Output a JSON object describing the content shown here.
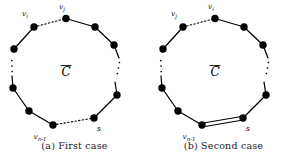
{
  "figure": {
    "panels": [
      {
        "id": "first-case",
        "caption": "(a) First case",
        "center_label": "C",
        "center_label_overline": true,
        "special_edge_style": "dashed",
        "labels": {
          "top_left": {
            "base": "v",
            "sub": "i",
            "text": "vi"
          },
          "top_right": {
            "base": "v",
            "sub": "j",
            "text": "vj"
          },
          "bottom_left": {
            "base": "v",
            "sub": "n-1",
            "text": "vn-1"
          },
          "bottom_right": {
            "base": "s",
            "sub": "",
            "text": "s"
          }
        },
        "vertices": [
          {
            "name": "vertex-top",
            "x": 66.0,
            "y": 18.5,
            "label": "v_j"
          },
          {
            "name": "vertex-upper-right",
            "x": 95.0,
            "y": 27.0,
            "label": ""
          },
          {
            "name": "vertex-right-upper",
            "x": 114.0,
            "y": 45.0,
            "label": ""
          },
          {
            "name": "vertex-right-lower",
            "x": 117.0,
            "y": 95.0,
            "label": ""
          },
          {
            "name": "vertex-lower-right",
            "x": 94.0,
            "y": 118.0,
            "label": "s"
          },
          {
            "name": "vertex-bottom",
            "x": 53.0,
            "y": 125.0,
            "label": "v_n-1"
          },
          {
            "name": "vertex-lower-left",
            "x": 29.0,
            "y": 111.0,
            "label": ""
          },
          {
            "name": "vertex-left-lower",
            "x": 13.0,
            "y": 88.0,
            "label": ""
          },
          {
            "name": "vertex-left-upper",
            "x": 14.0,
            "y": 49.0,
            "label": ""
          },
          {
            "name": "vertex-upper-left",
            "x": 34.0,
            "y": 27.0,
            "label": "v_i"
          }
        ]
      },
      {
        "id": "second-case",
        "caption": "(b) Second case",
        "center_label": "C",
        "center_label_overline": true,
        "special_edge_style": "double",
        "labels": {
          "top_left": {
            "base": "v",
            "sub": "j",
            "text": "vj"
          },
          "top_right": {
            "base": "v",
            "sub": "i",
            "text": "vi"
          },
          "bottom_left": {
            "base": "v",
            "sub": "n-1",
            "text": "vn-1"
          },
          "bottom_right": {
            "base": "s",
            "sub": "",
            "text": "s"
          }
        },
        "vertices": [
          {
            "name": "vertex-top",
            "x": 66.0,
            "y": 18.5,
            "label": "v_i"
          },
          {
            "name": "vertex-upper-right",
            "x": 95.0,
            "y": 27.0,
            "label": ""
          },
          {
            "name": "vertex-right-upper",
            "x": 114.0,
            "y": 45.0,
            "label": ""
          },
          {
            "name": "vertex-right-lower",
            "x": 117.0,
            "y": 95.0,
            "label": ""
          },
          {
            "name": "vertex-lower-right",
            "x": 94.0,
            "y": 118.0,
            "label": "s"
          },
          {
            "name": "vertex-bottom",
            "x": 53.0,
            "y": 125.0,
            "label": "v_n-1"
          },
          {
            "name": "vertex-lower-left",
            "x": 29.0,
            "y": 111.0,
            "label": ""
          },
          {
            "name": "vertex-left-lower",
            "x": 13.0,
            "y": 88.0,
            "label": ""
          },
          {
            "name": "vertex-left-upper",
            "x": 14.0,
            "y": 49.0,
            "label": ""
          },
          {
            "name": "vertex-upper-left",
            "x": 34.0,
            "y": 27.0,
            "label": "v_j"
          }
        ]
      }
    ],
    "colors": {
      "ink": "#000000",
      "background": "#ffffff"
    }
  }
}
